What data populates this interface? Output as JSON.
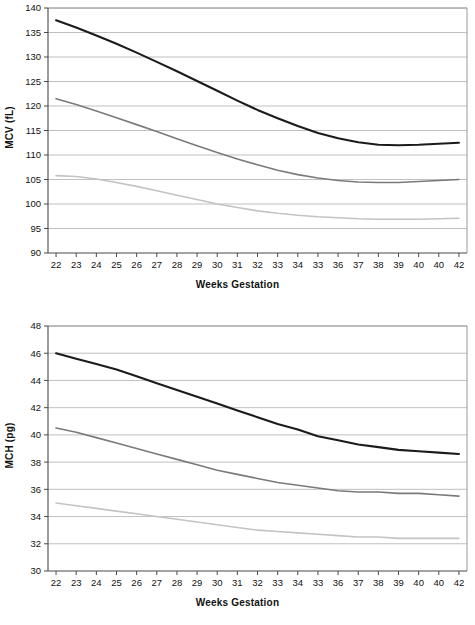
{
  "figure": {
    "background_color": "#ffffff"
  },
  "style": {
    "series_colors": {
      "upper": "#1b1b1b",
      "middle": "#7a7a7a",
      "lower": "#c3c3c3"
    },
    "gridline_color": "#b9b9b9",
    "axis_color": "#4a4a4a",
    "text_color": "#111111"
  },
  "charts": [
    {
      "id": "mcv",
      "name": "mcv-chart",
      "ylabel": "MCV (fL)",
      "xlabel": "Weeks Gestation"
    },
    {
      "id": "mch",
      "name": "mch-chart",
      "ylabel": "MCH (pg)",
      "xlabel": "Weeks Gestation"
    }
  ],
  "chart_data": [
    {
      "type": "line",
      "title": "MCV (fL) by Weeks Gestation",
      "xlabel": "Weeks Gestation",
      "ylabel": "MCV (fL)",
      "xlim": [
        21.6,
        42.4
      ],
      "ylim": [
        90,
        140
      ],
      "yticks": [
        90,
        95,
        100,
        105,
        110,
        115,
        120,
        125,
        130,
        135,
        140
      ],
      "ytick_labels": [
        "90",
        "95",
        "100",
        "105",
        "110",
        "115",
        "120",
        "125",
        "130",
        "135",
        "140"
      ],
      "x": [
        22,
        23,
        24,
        25,
        26,
        27,
        28,
        29,
        30,
        31,
        32,
        33,
        34,
        35,
        36,
        37,
        38,
        39,
        40,
        41,
        42
      ],
      "xtick_labels": [
        "22",
        "23",
        "24",
        "25",
        "26",
        "27",
        "28",
        "29",
        "30",
        "31",
        "32",
        "33",
        "34",
        "33",
        "36",
        "37",
        "38",
        "39",
        "40",
        "40",
        "42"
      ],
      "grid": true,
      "grid_axis": "y",
      "legend": "none",
      "series": [
        {
          "name": "upper",
          "color": "#1b1b1b",
          "width": 2.1,
          "values": [
            137.5,
            136.0,
            134.4,
            132.7,
            130.9,
            129.0,
            127.1,
            125.1,
            123.1,
            121.1,
            119.2,
            117.5,
            115.9,
            114.5,
            113.4,
            112.6,
            112.1,
            112.0,
            112.1,
            112.3,
            112.5
          ]
        },
        {
          "name": "middle",
          "color": "#7a7a7a",
          "width": 1.6,
          "values": [
            121.5,
            120.3,
            119.0,
            117.6,
            116.2,
            114.8,
            113.3,
            111.9,
            110.5,
            109.2,
            108.0,
            106.9,
            106.0,
            105.3,
            104.8,
            104.5,
            104.4,
            104.4,
            104.6,
            104.8,
            105.0
          ]
        },
        {
          "name": "lower",
          "color": "#c3c3c3",
          "width": 1.6,
          "values": [
            105.8,
            105.6,
            105.1,
            104.4,
            103.6,
            102.7,
            101.8,
            100.9,
            100.0,
            99.3,
            98.6,
            98.1,
            97.7,
            97.4,
            97.2,
            97.0,
            96.9,
            96.9,
            96.9,
            97.0,
            97.1
          ]
        }
      ]
    },
    {
      "type": "line",
      "title": "MCH (pg) by Weeks Gestation",
      "xlabel": "Weeks Gestation",
      "ylabel": "MCH (pg)",
      "xlim": [
        21.6,
        42.4
      ],
      "ylim": [
        30,
        48
      ],
      "yticks": [
        30,
        32,
        34,
        36,
        38,
        40,
        42,
        44,
        46,
        48
      ],
      "ytick_labels": [
        "30",
        "32",
        "34",
        "36",
        "38",
        "40",
        "42",
        "44",
        "46",
        "48"
      ],
      "x": [
        22,
        23,
        24,
        25,
        26,
        27,
        28,
        29,
        30,
        31,
        32,
        33,
        34,
        35,
        36,
        37,
        38,
        39,
        40,
        41,
        42
      ],
      "xtick_labels": [
        "22",
        "23",
        "24",
        "25",
        "26",
        "27",
        "28",
        "29",
        "30",
        "31",
        "32",
        "33",
        "34",
        "33",
        "36",
        "37",
        "38",
        "39",
        "40",
        "40",
        "42"
      ],
      "grid": true,
      "grid_axis": "y",
      "legend": "none",
      "series": [
        {
          "name": "upper",
          "color": "#1b1b1b",
          "width": 2.1,
          "values": [
            46.0,
            45.6,
            45.2,
            44.8,
            44.3,
            43.8,
            43.3,
            42.8,
            42.3,
            41.8,
            41.3,
            40.8,
            40.4,
            39.9,
            39.6,
            39.3,
            39.1,
            38.9,
            38.8,
            38.7,
            38.6
          ]
        },
        {
          "name": "middle",
          "color": "#7a7a7a",
          "width": 1.6,
          "values": [
            40.5,
            40.2,
            39.8,
            39.4,
            39.0,
            38.6,
            38.2,
            37.8,
            37.4,
            37.1,
            36.8,
            36.5,
            36.3,
            36.1,
            35.9,
            35.8,
            35.8,
            35.7,
            35.7,
            35.6,
            35.5
          ]
        },
        {
          "name": "lower",
          "color": "#c3c3c3",
          "width": 1.6,
          "values": [
            35.0,
            34.8,
            34.6,
            34.4,
            34.2,
            34.0,
            33.8,
            33.6,
            33.4,
            33.2,
            33.0,
            32.9,
            32.8,
            32.7,
            32.6,
            32.5,
            32.5,
            32.4,
            32.4,
            32.4,
            32.4
          ]
        }
      ]
    }
  ]
}
